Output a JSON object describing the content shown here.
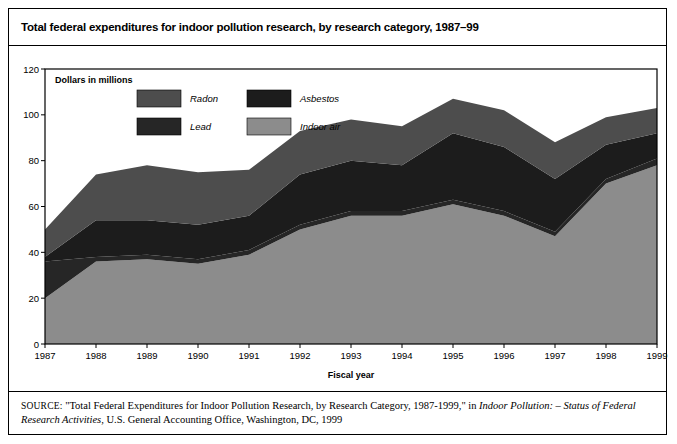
{
  "figure": {
    "title": "Total federal expenditures for indoor pollution research, by research category, 1987–99",
    "source_label": "SOURCE:",
    "source_text_1": "\"Total Federal Expenditures for Indoor Pollution Research, by Research Category, 1987-1999,\" in ",
    "source_italic_1": "Indoor Pollution: – Status of Federal Research Activities",
    "source_text_2": ", U.S. General Accounting Office, Washington, DC, 1999"
  },
  "plot": {
    "units_note": "Dollars in millions",
    "xaxis_title": "Fiscal year"
  },
  "colors": {
    "radon": "#4d4d4d",
    "asbestos": "#1c1c1c",
    "lead": "#262626",
    "indoor_air": "#8c8c8c",
    "plot_border": "#000000",
    "background": "#ffffff"
  },
  "chart_data": {
    "type": "area",
    "title": "Total federal expenditures for indoor pollution research, by research category, 1987–99",
    "subtitle": "Dollars in millions",
    "xlabel": "Fiscal year",
    "ylabel": "Dollars in millions",
    "stacked": true,
    "grid": false,
    "legend_position": "top-left-inside",
    "ylim": [
      0,
      120
    ],
    "yticks": [
      0,
      20,
      40,
      60,
      80,
      100,
      120
    ],
    "categories": [
      "1987",
      "1988",
      "1989",
      "1990",
      "1991",
      "1992",
      "1993",
      "1994",
      "1995",
      "1996",
      "1997",
      "1998",
      "1999"
    ],
    "series": [
      {
        "name": "Indoor air",
        "color": "#8c8c8c",
        "values": [
          20,
          36,
          37,
          35,
          39,
          50,
          56,
          56,
          61,
          56,
          47,
          70,
          78
        ]
      },
      {
        "name": "Lead",
        "color": "#262626",
        "values": [
          16,
          2,
          2,
          2,
          2,
          2,
          2,
          2,
          2,
          2,
          2,
          2,
          3
        ]
      },
      {
        "name": "Asbestos",
        "color": "#1c1c1c",
        "values": [
          2,
          16,
          15,
          15,
          15,
          22,
          22,
          20,
          29,
          28,
          23,
          15,
          11
        ]
      },
      {
        "name": "Radon",
        "color": "#4d4d4d",
        "values": [
          12,
          20,
          24,
          23,
          20,
          19,
          18,
          17,
          15,
          16,
          16,
          12,
          11
        ]
      }
    ],
    "cumulative_tops": {
      "indoor_air": [
        20,
        36,
        37,
        35,
        39,
        50,
        56,
        56,
        61,
        56,
        47,
        70,
        78
      ],
      "lead": [
        36,
        38,
        39,
        37,
        41,
        52,
        58,
        58,
        63,
        58,
        49,
        72,
        81
      ],
      "asbestos": [
        38,
        54,
        54,
        52,
        56,
        74,
        80,
        78,
        92,
        86,
        72,
        87,
        92
      ],
      "radon": [
        50,
        74,
        78,
        75,
        76,
        93,
        98,
        95,
        107,
        102,
        88,
        99,
        103
      ]
    }
  },
  "legend": [
    {
      "name": "Radon",
      "color": "#4d4d4d"
    },
    {
      "name": "Asbestos",
      "color": "#1c1c1c"
    },
    {
      "name": "Lead",
      "color": "#262626"
    },
    {
      "name": "Indoor air",
      "color": "#8c8c8c"
    }
  ]
}
